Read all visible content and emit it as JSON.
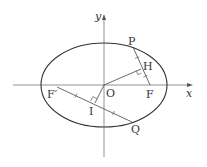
{
  "diagram": {
    "title": "",
    "axes": {
      "x_label": "x",
      "y_label": "y"
    },
    "points": {
      "origin": "O",
      "P": "P",
      "H": "H",
      "F": "F",
      "F_prime": "F′",
      "I": "I",
      "Q": "Q"
    },
    "elements": [
      "ellipse centered at origin",
      "segment PF through H",
      "segment OH perpendicular to PF",
      "segment F′Q through I",
      "segment OI perpendicular to F′Q",
      "tick marks showing equal lengths: PH = HF, F′I = IQ"
    ],
    "colors": {
      "stroke": "#333333",
      "axis": "#666666",
      "background": "#ffffff"
    }
  }
}
